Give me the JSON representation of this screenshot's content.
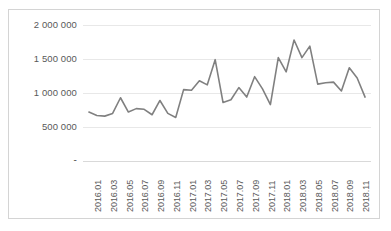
{
  "chart_data": {
    "type": "line",
    "title": "",
    "subtitle": "",
    "xlabel": "",
    "ylabel": "",
    "grid": true,
    "grid_orientation": "horizontal",
    "legend": false,
    "legend_position": "none",
    "line_color": "#808080",
    "line_width": 1.6,
    "markers": false,
    "plot_background": "#ffffff",
    "border_color": "#d4d4d4",
    "axis_color": "#d9d9d9",
    "tick_label_color": "#595959",
    "ylim": [
      0,
      2000000
    ],
    "ytick_values": [
      0,
      500000,
      1000000,
      1500000,
      2000000
    ],
    "ytick_labels": [
      "-",
      "500 000",
      "1 000 000",
      "1 500 000",
      "2 000 000"
    ],
    "x": [
      "2016.01",
      "2016.02",
      "2016.03",
      "2016.04",
      "2016.05",
      "2016.06",
      "2016.07",
      "2016.08",
      "2016.09",
      "2016.10",
      "2016.11",
      "2016.12",
      "2017.01",
      "2017.02",
      "2017.03",
      "2017.04",
      "2017.05",
      "2017.06",
      "2017.07",
      "2017.08",
      "2017.09",
      "2017.10",
      "2017.11",
      "2017.12",
      "2018.01",
      "2018.02",
      "2018.03",
      "2018.04",
      "2018.05",
      "2018.06",
      "2018.07",
      "2018.08",
      "2018.09",
      "2018.10",
      "2018.11",
      "2018.12"
    ],
    "xtick_labels": [
      "2016.01",
      "2016.03",
      "2016.05",
      "2016.07",
      "2016.09",
      "2016.11",
      "2017.01",
      "2017.03",
      "2017.05",
      "2017.07",
      "2017.09",
      "2017.11",
      "2018.01",
      "2018.03",
      "2018.05",
      "2018.07",
      "2018.09",
      "2018.11"
    ],
    "xtick_step": 2,
    "values": [
      720000,
      670000,
      660000,
      700000,
      930000,
      720000,
      770000,
      760000,
      680000,
      890000,
      700000,
      640000,
      1050000,
      1040000,
      1180000,
      1120000,
      1490000,
      860000,
      900000,
      1080000,
      940000,
      1240000,
      1060000,
      830000,
      1520000,
      1310000,
      1780000,
      1520000,
      1690000,
      1130000,
      1150000,
      1160000,
      1030000,
      1370000,
      1220000,
      940000
    ]
  }
}
